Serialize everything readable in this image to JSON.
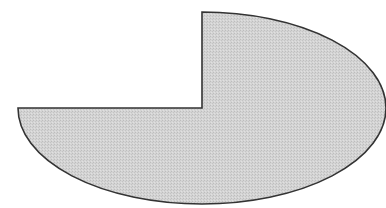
{
  "shape": {
    "type": "ellipse-with-quadrant-removed",
    "center": [
      202,
      108
    ],
    "rx": 184,
    "ry": 96,
    "removed_quadrant": "top-left",
    "fill": "#cfcfcf",
    "stroke": "#333333"
  }
}
